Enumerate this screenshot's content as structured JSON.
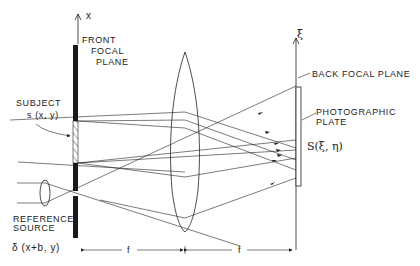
{
  "labels": {
    "x_axis": "x",
    "xi_axis": "ξ",
    "front_focal_plane": [
      "FRONT",
      "FOCAL",
      "PLANE"
    ],
    "subject": "SUBJECT",
    "subject_function": "s (x, y)",
    "reference_source": [
      "REFERENCE",
      "SOURCE"
    ],
    "reference_function": "δ (x+b, y)",
    "back_focal_plane": "BACK FOCAL PLANE",
    "photographic_plate": [
      "PHOTOGRAPHIC",
      "PLATE"
    ],
    "spectrum_function": "S(ξ, η)",
    "focal_length_left": "f",
    "focal_length_right": "f"
  },
  "colors": {
    "ink": "#222222",
    "background": "#ffffff"
  }
}
